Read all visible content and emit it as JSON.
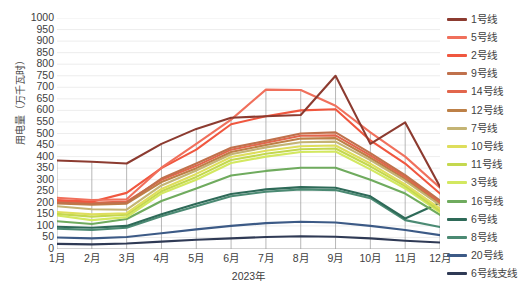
{
  "chart_data": {
    "type": "line",
    "title": "",
    "xlabel": "2023年",
    "ylabel": "用电量（万千瓦时）",
    "categories": [
      "1月",
      "2月",
      "3月",
      "4月",
      "5月",
      "6月",
      "7月",
      "8月",
      "9月",
      "10月",
      "11月",
      "12月"
    ],
    "ylim": [
      0,
      1000
    ],
    "ytick_step": 50,
    "yticks": [
      "1000",
      "950",
      "900",
      "850",
      "800",
      "750",
      "700",
      "650",
      "600",
      "550",
      "500",
      "450",
      "400",
      "350",
      "300",
      "250",
      "200",
      "150",
      "100",
      "50",
      "0"
    ],
    "grid": true,
    "legend_position": "right",
    "series": [
      {
        "name": "1号线",
        "color": "#8c3b30",
        "values": [
          383,
          378,
          370,
          455,
          520,
          568,
          575,
          580,
          750,
          455,
          548,
          270
        ]
      },
      {
        "name": "5号线",
        "color": "#f0705c",
        "values": [
          222,
          212,
          215,
          352,
          455,
          560,
          690,
          688,
          620,
          505,
          400,
          265
        ]
      },
      {
        "name": "2号线",
        "color": "#f0573f",
        "values": [
          212,
          205,
          243,
          350,
          430,
          540,
          575,
          600,
          605,
          470,
          370,
          240
        ]
      },
      {
        "name": "9号线",
        "color": "#c0714c",
        "values": [
          200,
          196,
          200,
          305,
          370,
          438,
          468,
          500,
          505,
          415,
          320,
          210
        ]
      },
      {
        "name": "14号线",
        "color": "#e2664c",
        "values": [
          205,
          200,
          205,
          300,
          360,
          430,
          460,
          490,
          492,
          405,
          312,
          205
        ]
      },
      {
        "name": "12号线",
        "color": "#bd8047",
        "values": [
          197,
          192,
          196,
          290,
          350,
          420,
          450,
          478,
          480,
          395,
          305,
          200
        ]
      },
      {
        "name": "7号线",
        "color": "#c4b474",
        "values": [
          185,
          172,
          170,
          275,
          340,
          410,
          440,
          462,
          465,
          385,
          295,
          190
        ]
      },
      {
        "name": "10号线",
        "color": "#dede5c",
        "values": [
          160,
          150,
          155,
          260,
          325,
          398,
          425,
          445,
          448,
          370,
          280,
          175
        ]
      },
      {
        "name": "11号线",
        "color": "#c4d84f",
        "values": [
          152,
          140,
          148,
          250,
          312,
          385,
          412,
          432,
          435,
          358,
          272,
          165
        ]
      },
      {
        "name": "3号线",
        "color": "#d3e860",
        "values": [
          145,
          125,
          138,
          240,
          300,
          372,
          400,
          420,
          422,
          345,
          262,
          158
        ]
      },
      {
        "name": "16号线",
        "color": "#6fab5e",
        "values": [
          120,
          108,
          130,
          208,
          262,
          318,
          338,
          352,
          352,
          300,
          240,
          148
        ]
      },
      {
        "name": "6号线",
        "color": "#2e6a58",
        "values": [
          96,
          92,
          100,
          150,
          196,
          238,
          258,
          268,
          265,
          228,
          132,
          200
        ]
      },
      {
        "name": "8号线",
        "color": "#4b8a73",
        "values": [
          88,
          82,
          92,
          142,
          185,
          228,
          248,
          258,
          255,
          220,
          125,
          95
        ]
      },
      {
        "name": "20号线",
        "color": "#3c5a86",
        "values": [
          50,
          46,
          52,
          68,
          85,
          100,
          112,
          118,
          115,
          100,
          82,
          60
        ]
      },
      {
        "name": "6号线支线",
        "color": "#2f3a55",
        "values": [
          22,
          20,
          24,
          32,
          40,
          46,
          52,
          55,
          53,
          46,
          36,
          28
        ]
      }
    ]
  },
  "style": {
    "grid_color": "#e8e8e8",
    "axis_color": "#a6a6a6",
    "text_color": "#404040",
    "background": "#ffffff"
  }
}
